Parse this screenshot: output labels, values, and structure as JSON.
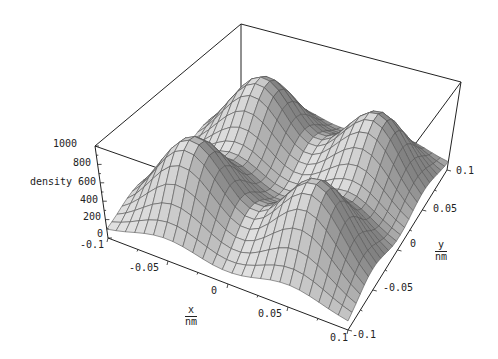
{
  "chart_data": {
    "type": "surface3d",
    "title": "",
    "xlabel": {
      "num": "x",
      "den": "nm"
    },
    "ylabel": {
      "num": "y",
      "den": "nm"
    },
    "zlabel": "density",
    "xlim": [
      -0.1,
      0.1
    ],
    "ylim": [
      -0.1,
      0.1
    ],
    "zlim": [
      0,
      1000
    ],
    "x_ticks": [
      "-0.1",
      "-0.05",
      "0",
      "0.05",
      "0.1"
    ],
    "y_ticks": [
      "-0.1",
      "-0.05",
      "0",
      "0.05",
      "0.1"
    ],
    "z_ticks": [
      "0",
      "200",
      "400",
      "600",
      "800",
      "1000"
    ],
    "grid_resolution": 25,
    "surface": {
      "description": "Four Gaussian-like density peaks arranged on a square lattice",
      "peaks": [
        {
          "x": -0.05,
          "y": -0.05,
          "height": 900,
          "sigma": 0.028
        },
        {
          "x": 0.05,
          "y": -0.05,
          "height": 880,
          "sigma": 0.028
        },
        {
          "x": -0.05,
          "y": 0.05,
          "height": 850,
          "sigma": 0.028
        },
        {
          "x": 0.05,
          "y": 0.05,
          "height": 820,
          "sigma": 0.028
        }
      ],
      "baseline": 60,
      "surface_color": "#c8c8c8",
      "mesh_color": "#555555"
    },
    "box": true,
    "grid": false,
    "legend": null
  }
}
